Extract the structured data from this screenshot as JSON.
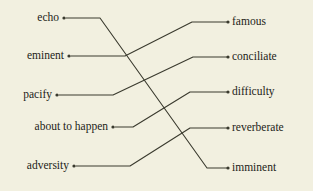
{
  "worksheet": {
    "background_color": "#f2f0e0",
    "ink_color": "#3a3a2e",
    "text_color": "#1d1d18",
    "width": 313,
    "height": 191
  },
  "left_column": {
    "items": [
      {
        "label": "echo",
        "dot_x": 64,
        "dot_y": 18
      },
      {
        "label": "eminent",
        "dot_x": 69,
        "dot_y": 56
      },
      {
        "label": "pacify",
        "dot_x": 57,
        "dot_y": 95
      },
      {
        "label": "about to happen",
        "dot_x": 113,
        "dot_y": 127
      },
      {
        "label": "adversity",
        "dot_x": 74,
        "dot_y": 166
      }
    ]
  },
  "right_column": {
    "items": [
      {
        "label": "famous",
        "dot_x": 228,
        "dot_y": 22
      },
      {
        "label": "conciliate",
        "dot_x": 228,
        "dot_y": 57
      },
      {
        "label": "difficulty",
        "dot_x": 228,
        "dot_y": 92
      },
      {
        "label": "reverberate",
        "dot_x": 228,
        "dot_y": 128
      },
      {
        "label": "imminent",
        "dot_x": 228,
        "dot_y": 168
      }
    ]
  },
  "connections": [
    {
      "from": "echo",
      "to": "imminent",
      "points": "66,18 100,18 207,168 228,168"
    },
    {
      "from": "eminent",
      "to": "famous",
      "points": "71,56 125,56 192,22 228,22"
    },
    {
      "from": "pacify",
      "to": "conciliate",
      "points": "59,95 113,95 193,57 228,57"
    },
    {
      "from": "about to happen",
      "to": "difficulty",
      "points": "115,127 133,127 190,92 228,92"
    },
    {
      "from": "adversity",
      "to": "reverberate",
      "points": "76,166 130,166 190,128 228,128"
    }
  ]
}
